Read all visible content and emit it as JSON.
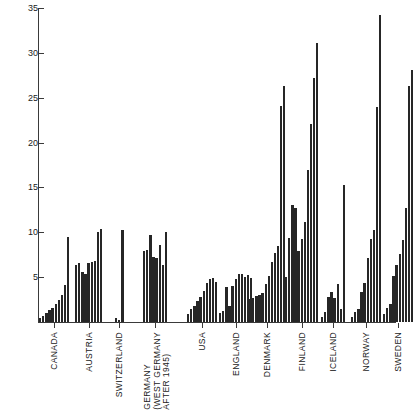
{
  "chart_data": {
    "type": "bar",
    "title": "",
    "xlabel": "",
    "ylabel": "",
    "ylim": [
      0,
      35
    ],
    "y_ticks": [
      0,
      5,
      10,
      15,
      20,
      25,
      30,
      35
    ],
    "y_tick_labels": [
      "",
      "5",
      "10",
      "15",
      "20",
      "25",
      "30",
      "35"
    ],
    "grid": false,
    "legend": "none",
    "categories": [
      "CANADA",
      "AUSTRIA",
      "SWITZERLAND",
      "GERMANY\n(WEST GERMANY\nAFTER 1945)",
      "USA",
      "ENGLAND",
      "DENMARK",
      "FINLAND",
      "ICELAND",
      "NORWAY",
      "SWEDEN"
    ],
    "groups": [
      {
        "name": "CANADA",
        "values": [
          0.5,
          0.7,
          1.0,
          1.3,
          1.6,
          2.0,
          2.4,
          3.0,
          4.1,
          9.5
        ]
      },
      {
        "name": "AUSTRIA",
        "values": [
          6.4,
          6.6,
          5.6,
          5.3,
          6.6,
          6.7,
          6.8,
          10.0,
          10.4
        ]
      },
      {
        "name": "SWITZERLAND",
        "values": [
          0.4,
          0.2,
          10.3
        ]
      },
      {
        "name": "GERMANY (WEST GERMANY AFTER 1945)",
        "values": [
          7.9,
          8.0,
          9.7,
          7.2,
          7.1,
          8.6,
          6.3,
          10.0
        ]
      },
      {
        "name": "USA",
        "values": [
          0.9,
          1.4,
          1.8,
          2.3,
          2.8,
          3.5,
          4.3,
          4.8,
          4.9,
          4.5
        ]
      },
      {
        "name": "ENGLAND",
        "values": [
          1.0,
          1.2,
          3.9,
          1.8,
          4.0,
          4.8,
          5.3,
          5.4,
          5.0,
          5.2,
          4.9
        ]
      },
      {
        "name": "DENMARK",
        "values": [
          2.6,
          2.7,
          2.9,
          3.0,
          3.2,
          4.2,
          5.1,
          6.7,
          7.7,
          8.5,
          24.1,
          26.3
        ]
      },
      {
        "name": "FINLAND",
        "values": [
          5.0,
          9.4,
          13.0,
          12.7,
          7.9,
          9.3,
          11.1,
          17.0,
          22.1,
          27.2,
          31.1
        ]
      },
      {
        "name": "ICELAND",
        "values": [
          0.6,
          1.1,
          2.8,
          3.3,
          2.7,
          4.2,
          1.4,
          15.3
        ]
      },
      {
        "name": "NORWAY",
        "values": [
          0.6,
          1.1,
          1.4,
          3.3,
          4.4,
          7.1,
          9.2,
          10.3,
          24.0,
          34.2
        ]
      },
      {
        "name": "SWEDEN",
        "values": [
          0.9,
          1.6,
          2.0,
          5.1,
          6.4,
          7.6,
          9.1,
          12.7,
          26.3,
          28.1
        ]
      }
    ]
  }
}
